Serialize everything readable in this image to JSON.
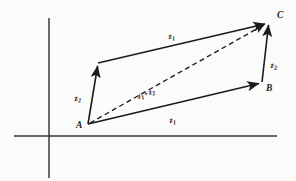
{
  "figure": {
    "background_color": "#fbfbfa",
    "ink_color": "#1b1b1b",
    "axis_color": "#3a3a3a",
    "points": {
      "a": "A",
      "b": "B",
      "c": "C"
    },
    "vectors": {
      "z1_top": {
        "base": "z",
        "sub": "1"
      },
      "z1_bottom": {
        "base": "z",
        "sub": "1"
      },
      "z2_left": {
        "base": "z",
        "sub": "2"
      },
      "z2_right": {
        "base": "z",
        "sub": "2"
      },
      "sum": {
        "base1": "z",
        "sub1": "1",
        "plus": "+",
        "base2": "z",
        "sub2": "2"
      }
    },
    "geometry": {
      "origin": {
        "x": 49,
        "y": 136
      },
      "vertex_a": {
        "x": 88,
        "y": 124
      },
      "vertex_b": {
        "x": 262,
        "y": 82
      },
      "vertex_c": {
        "x": 268,
        "y": 22
      },
      "vertex_d": {
        "x": 98,
        "y": 63
      }
    }
  }
}
